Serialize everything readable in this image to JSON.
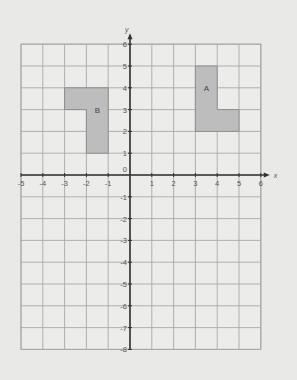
{
  "diagram": {
    "type": "coordinate-grid",
    "x_axis": {
      "label": "x",
      "min": -5,
      "max": 6,
      "ticks": [
        "-5",
        "-4",
        "-3",
        "-2",
        "-1",
        "1",
        "2",
        "3",
        "4",
        "5",
        "6"
      ]
    },
    "y_axis": {
      "label": "y",
      "min": -8,
      "max": 6,
      "ticks": [
        "6",
        "5",
        "4",
        "3",
        "2",
        "1",
        "-1",
        "-2",
        "-3",
        "-4",
        "-5",
        "-6",
        "-7",
        "-8"
      ]
    },
    "origin_label": "0",
    "shapes": [
      {
        "label": "A",
        "vertices": [
          [
            3,
            2
          ],
          [
            3,
            5
          ],
          [
            4,
            5
          ],
          [
            4,
            3
          ],
          [
            5,
            3
          ],
          [
            5,
            2
          ]
        ],
        "label_pos": [
          3.5,
          4
        ],
        "fill": "#bdbdbd"
      },
      {
        "label": "B",
        "vertices": [
          [
            -3,
            4
          ],
          [
            -1,
            4
          ],
          [
            -1,
            1
          ],
          [
            -2,
            1
          ],
          [
            -2,
            3
          ],
          [
            -3,
            3
          ]
        ],
        "label_pos": [
          -1.5,
          3
        ],
        "fill": "#bdbdbd"
      }
    ],
    "colors": {
      "background": "#e9e9e7",
      "grid": "#a9a9a9",
      "axis": "#333333"
    }
  }
}
